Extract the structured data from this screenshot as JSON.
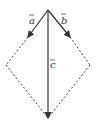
{
  "diagram": {
    "type": "vector-parallelogram",
    "vectors": [
      {
        "name": "a",
        "label": "a",
        "from": "top",
        "to": "left",
        "style": "solid-arrow"
      },
      {
        "name": "b",
        "label": "b",
        "from": "top",
        "to": "right",
        "style": "solid-arrow"
      },
      {
        "name": "c",
        "label": "c",
        "from": "top",
        "to": "bottom",
        "style": "solid-arrow"
      }
    ],
    "dashed_edges": [
      "left-to-bottom",
      "right-to-bottom",
      "a-tip-to-left",
      "b-tip-to-right"
    ],
    "colors": {
      "stroke": "#333333",
      "background": "#ffffff"
    }
  },
  "labels": {
    "a": "a",
    "b": "b",
    "c": "c"
  }
}
